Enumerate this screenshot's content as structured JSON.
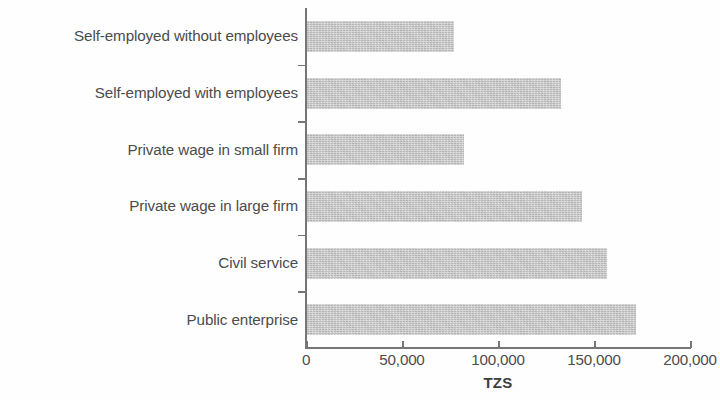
{
  "chart_data": {
    "type": "bar",
    "orientation": "horizontal",
    "title": "",
    "subtitle": "",
    "xlabel": "TZS",
    "ylabel": "",
    "categories": [
      "Self-employed without employees",
      "Self-employed with employees",
      "Private wage in small firm",
      "Private wage in large firm",
      "Civil service",
      "Public enterprise"
    ],
    "values": [
      77000,
      133000,
      82500,
      144000,
      157000,
      172000
    ],
    "xlim": [
      0,
      200000
    ],
    "xticks": [
      0,
      50000,
      100000,
      150000,
      200000
    ],
    "xtick_labels": [
      "0",
      "50,000",
      "100,000",
      "150,000",
      "200,000"
    ],
    "grid": false,
    "legend": null,
    "series": [
      {
        "name": "Earnings",
        "values": [
          77000,
          133000,
          82500,
          144000,
          157000,
          172000
        ]
      }
    ],
    "colors": {
      "bar_fill": "#c6c6c6",
      "axis": "#767676",
      "text": "#4c4c4c",
      "background": "#fefefe"
    }
  }
}
